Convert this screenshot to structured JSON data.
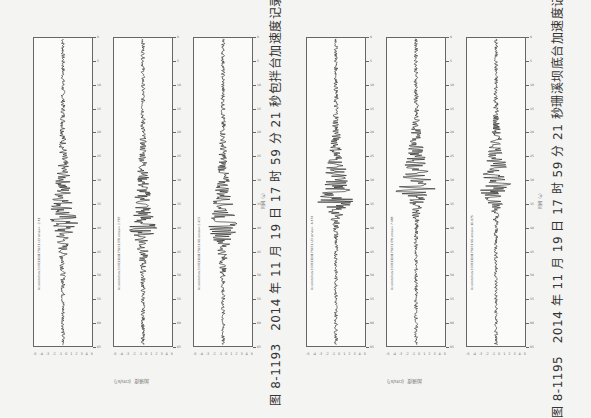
{
  "figures": [
    {
      "caption": "图 8-1193　2014 年 11 月 19 日 17 时 59 分 21 秒包拌台加速度记录",
      "time_axis_label": "时间（s）",
      "accel_axis_label": "加速度（cm/s²）",
      "panels": [
        {
          "header": "Acceleration 20081119175921 UD amax= -2.41",
          "peak_pos": 0.6,
          "amp": 0.5
        },
        {
          "header": "Acceleration 20081119175921 EW amax= 2.787",
          "peak_pos": 0.62,
          "amp": 0.45
        },
        {
          "header": "Acceleration 20081119175921 NS amax=-2.423",
          "peak_pos": 0.62,
          "amp": 0.48
        }
      ]
    },
    {
      "caption": "图 8-1195　2014 年 11 月 19 日 17 时 59 分 21 秒珊溪坝底台加速度记录",
      "time_axis_label": "时间（s）",
      "accel_axis_label": "加速度（cm/s²）",
      "panels": [
        {
          "header": "Acceleration 20081119175921 UD amax= -6.474",
          "peak_pos": 0.53,
          "amp": 0.62
        },
        {
          "header": "Acceleration 20081119175921 EW amax= 7.488",
          "peak_pos": 0.5,
          "amp": 0.65
        },
        {
          "header": "Acceleration 20081119175921 NS amax= 11.975",
          "peak_pos": 0.5,
          "amp": 0.6
        }
      ]
    }
  ],
  "time_ticks": [
    "0",
    "5",
    "10",
    "15",
    "20",
    "25",
    "30",
    "35",
    "40",
    "45",
    "50",
    "55",
    "60",
    "65"
  ],
  "accel_ticks": [
    "-5",
    "-4",
    "-3",
    "-2",
    "-1",
    "0",
    "1",
    "2",
    "3",
    "4",
    "5"
  ]
}
